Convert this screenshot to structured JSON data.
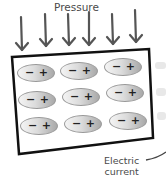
{
  "diagram": {
    "title": "Pressure",
    "arrow_count": 6,
    "output_label_line1": "Electric",
    "output_label_line2": "current",
    "dipole_negative": "−",
    "dipole_positive": "+",
    "grid": {
      "rows": 3,
      "cols": 3
    },
    "colors": {
      "outline": "#111111",
      "arrow": "#555555",
      "stripes": "#e6e6e6"
    }
  }
}
